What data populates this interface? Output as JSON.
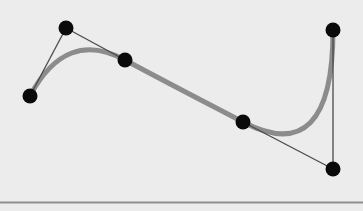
{
  "diagram": {
    "type": "bezier-spline",
    "background_color": "#ececec",
    "curve": {
      "color": "#8c8c8c",
      "width": 5,
      "segments": [
        {
          "kind": "quadratic",
          "from": "P0",
          "control": "P1",
          "to": "P2"
        },
        {
          "kind": "smooth-connector",
          "from": "P2",
          "to": "P3"
        },
        {
          "kind": "quadratic",
          "from": "P3",
          "control": "P5",
          "to": "P4"
        }
      ]
    },
    "control_lines": {
      "color": "#4a4a4a",
      "width": 1.3,
      "lines": [
        [
          "P0",
          "P1"
        ],
        [
          "P1",
          "P2"
        ],
        [
          "P3",
          "P5"
        ],
        [
          "P5",
          "P4"
        ]
      ]
    },
    "points": [
      {
        "id": "P0",
        "x": 30,
        "y": 96
      },
      {
        "id": "P1",
        "x": 66,
        "y": 28
      },
      {
        "id": "P2",
        "x": 125,
        "y": 60
      },
      {
        "id": "P3",
        "x": 243,
        "y": 122
      },
      {
        "id": "P4",
        "x": 333,
        "y": 30
      },
      {
        "id": "P5",
        "x": 333,
        "y": 169
      }
    ],
    "point_style": {
      "color": "#0a0a0a",
      "radius": 7.5
    },
    "baseline": {
      "y": 202.5,
      "color": "#8e8e8e",
      "width": 2
    }
  }
}
